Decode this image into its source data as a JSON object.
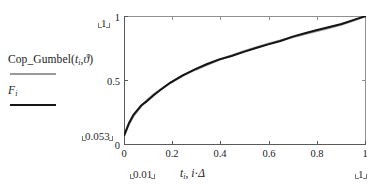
{
  "legend": {
    "series": [
      {
        "name": "cop-gumbel",
        "label_main": "Cop_Gumbel(",
        "label_var": "t",
        "label_sub": "i",
        "label_comma": ",",
        "label_theta": "ϑ",
        "label_close": ")",
        "color": "#9a9a9a"
      },
      {
        "name": "empirical-f",
        "label_var": "F",
        "label_sub": "i",
        "color": "#141414"
      }
    ]
  },
  "axis": {
    "x": {
      "caption_var1": "t",
      "caption_sub1": "i",
      "caption_sep": ", ",
      "caption_var2": "i",
      "caption_dot": "·",
      "caption_var3": "Δ",
      "ticks": [
        "0",
        "0.2",
        "0.4",
        "0.6",
        "0.8",
        "1"
      ],
      "min_placeholder": "0.01",
      "max_placeholder": "1"
    },
    "y": {
      "ticks": [
        "1",
        "0.5",
        "0"
      ],
      "min_placeholder": "0.053",
      "max_placeholder": "1"
    }
  },
  "chart_data": {
    "type": "line",
    "title": "",
    "xlabel": "t_i, i·Δ",
    "ylabel": "",
    "xlim": [
      0.01,
      1
    ],
    "ylim": [
      0.053,
      1
    ],
    "xticks": [
      0,
      0.2,
      0.4,
      0.6,
      0.8,
      1
    ],
    "yticks": [
      0,
      0.5,
      1
    ],
    "grid": false,
    "legend_position": "left-outside",
    "series": [
      {
        "name": "Cop_Gumbel(t_i,ϑ)",
        "color": "#9a9a9a",
        "x": [
          0.01,
          0.03,
          0.05,
          0.08,
          0.1,
          0.13,
          0.16,
          0.2,
          0.25,
          0.3,
          0.35,
          0.4,
          0.45,
          0.5,
          0.55,
          0.6,
          0.65,
          0.7,
          0.75,
          0.8,
          0.85,
          0.9,
          0.95,
          1.0
        ],
        "y": [
          0.07,
          0.16,
          0.228,
          0.3,
          0.34,
          0.39,
          0.432,
          0.482,
          0.536,
          0.582,
          0.622,
          0.66,
          0.694,
          0.726,
          0.756,
          0.784,
          0.81,
          0.836,
          0.86,
          0.884,
          0.908,
          0.934,
          0.966,
          1.0
        ]
      },
      {
        "name": "F_i",
        "color": "#141414",
        "x": [
          0.01,
          0.03,
          0.05,
          0.08,
          0.1,
          0.13,
          0.16,
          0.2,
          0.25,
          0.3,
          0.35,
          0.4,
          0.45,
          0.5,
          0.55,
          0.6,
          0.65,
          0.7,
          0.75,
          0.8,
          0.85,
          0.9,
          0.95,
          1.0
        ],
        "y": [
          0.072,
          0.168,
          0.238,
          0.306,
          0.334,
          0.384,
          0.428,
          0.484,
          0.54,
          0.586,
          0.628,
          0.664,
          0.69,
          0.722,
          0.752,
          0.78,
          0.806,
          0.84,
          0.866,
          0.892,
          0.914,
          0.938,
          0.97,
          1.0
        ]
      }
    ]
  }
}
